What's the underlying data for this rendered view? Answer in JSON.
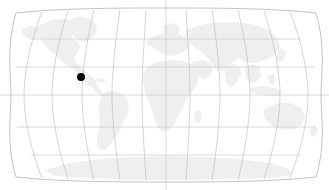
{
  "widget": {
    "name": "world-map-locator",
    "background_color": "#ffffff",
    "width": 329,
    "height": 190
  },
  "map": {
    "projection": "robinson",
    "land_color": "#efefef",
    "graticule_color": "#bdbdbd",
    "outline_color": "#a9a9a9",
    "center_longitude": 0,
    "bounds": {
      "left_px": 11,
      "right_px": 321,
      "top_px": 10,
      "bottom_px": 180
    },
    "graticule": {
      "meridian_step_degrees": 30,
      "parallel_step_degrees": 30,
      "meridian_count": 12,
      "parallel_count": 5,
      "parallel_latitudes": [
        60,
        30,
        0,
        -30,
        -60
      ],
      "meridian_longitudes": [
        -180,
        -150,
        -120,
        -90,
        -60,
        -30,
        0,
        30,
        60,
        90,
        120,
        150,
        180
      ],
      "central_meridian_extends_beyond_frame": true
    },
    "continents": [
      "north-america",
      "south-america",
      "europe",
      "africa",
      "asia",
      "australia",
      "antarctica",
      "greenland"
    ]
  },
  "markers": [
    {
      "id": "marker-1",
      "label": "",
      "color": "#000000",
      "radius_px": 4,
      "x_px": 81,
      "y_px": 77,
      "approx_longitude": -81,
      "approx_latitude": 21
    }
  ]
}
